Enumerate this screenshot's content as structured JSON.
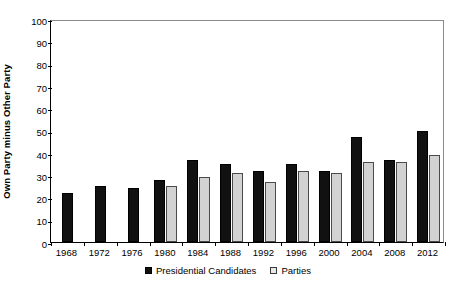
{
  "chart_data": {
    "type": "bar",
    "title": "",
    "xlabel": "",
    "ylabel": "Own Party minus Other Party",
    "ylim": [
      0,
      100
    ],
    "yticks": [
      0,
      10,
      20,
      30,
      40,
      50,
      60,
      70,
      80,
      90,
      100
    ],
    "grid": false,
    "legend_position": "bottom",
    "categories": [
      "1968",
      "1972",
      "1976",
      "1980",
      "1984",
      "1988",
      "1992",
      "1996",
      "2000",
      "2004",
      "2008",
      "2012"
    ],
    "series": [
      {
        "name": "Presidential Candidates",
        "color": "#111111",
        "values": [
          22,
          25,
          24,
          28,
          37,
          35,
          32,
          35,
          32,
          47,
          37,
          50
        ]
      },
      {
        "name": "Parties",
        "color": "#d2d2d2",
        "values": [
          null,
          null,
          null,
          25,
          29,
          31,
          27,
          32,
          31,
          36,
          36,
          39
        ]
      }
    ]
  },
  "legend": {
    "entries": [
      {
        "label": "Presidential Candidates"
      },
      {
        "label": "Parties"
      }
    ]
  }
}
